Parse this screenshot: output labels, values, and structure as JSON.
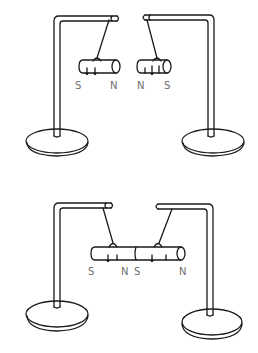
{
  "figure": {
    "colors": {
      "line": "#1a1a1a",
      "label": "#6e6e6e",
      "background": "#ffffff"
    },
    "top_scene": {
      "caption": "Two separate magnets with like poles (N-N) facing each other, repelling",
      "left_magnet_labels": {
        "left": "S",
        "right": "N"
      },
      "right_magnet_labels": {
        "left": "N",
        "right": "S"
      }
    },
    "bottom_scene": {
      "caption": "Two magnets joined end to end (N-S) forming one bar",
      "left_magnet_labels": {
        "left": "S",
        "right": "N"
      },
      "right_magnet_labels": {
        "left": "S",
        "right": "N"
      }
    }
  }
}
